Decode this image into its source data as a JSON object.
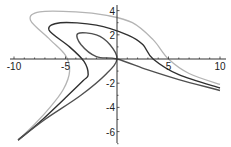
{
  "chart_data": {
    "type": "line",
    "title": "",
    "xlabel": "",
    "ylabel": "",
    "xlim": [
      -10,
      10
    ],
    "ylim": [
      -7,
      4.5
    ],
    "grid": false,
    "legend": null,
    "x_ticks": [
      "-10",
      "-5",
      "5",
      "10"
    ],
    "y_ticks": [
      "4",
      "2",
      "-2",
      "-4",
      "-6"
    ],
    "series": [
      {
        "name": "outer-curve",
        "color": "#b4b4b4",
        "points": [
          [
            -9.6,
            -6.7
          ],
          [
            -8,
            -5.4
          ],
          [
            -6.5,
            -4
          ],
          [
            -5.2,
            -2.5
          ],
          [
            -4.6,
            -1
          ],
          [
            -5,
            0.3
          ],
          [
            -6.5,
            1.6
          ],
          [
            -8.4,
            3.2
          ],
          [
            -7.5,
            3.9
          ],
          [
            -4,
            3.9
          ],
          [
            -1,
            3.6
          ],
          [
            1.5,
            3
          ],
          [
            3.5,
            1.6
          ],
          [
            5,
            0
          ],
          [
            7,
            -1.2
          ],
          [
            10,
            -2.1
          ]
        ]
      },
      {
        "name": "middle-curve",
        "color": "#303030",
        "points": [
          [
            -9.6,
            -6.7
          ],
          [
            -7.5,
            -5.2
          ],
          [
            -5,
            -3.2
          ],
          [
            -3.3,
            -1.8
          ],
          [
            -2.8,
            -1.3
          ],
          [
            -3.2,
            -0.2
          ],
          [
            -4.6,
            1
          ],
          [
            -6.6,
            2.4
          ],
          [
            -5.5,
            3
          ],
          [
            -2,
            2.8
          ],
          [
            1,
            2
          ],
          [
            2.5,
            1.2
          ],
          [
            3.5,
            0
          ],
          [
            6,
            -1.3
          ],
          [
            10,
            -2.4
          ]
        ]
      },
      {
        "name": "inner-curve",
        "color": "#505050",
        "points": [
          [
            -9.6,
            -6.7
          ],
          [
            -7,
            -5
          ],
          [
            -3.5,
            -3
          ],
          [
            -1,
            -1.2
          ],
          [
            0,
            0
          ],
          [
            -0.7,
            1.2
          ],
          [
            -2,
            2
          ],
          [
            -3.8,
            2.1
          ],
          [
            -3.5,
            1.2
          ],
          [
            -2,
            0.2
          ],
          [
            0,
            0
          ],
          [
            3,
            -0.9
          ],
          [
            6,
            -1.7
          ],
          [
            10,
            -2.6
          ]
        ]
      }
    ]
  },
  "axes": {
    "x_labels": [
      {
        "text": "-10",
        "value": -10
      },
      {
        "text": "-5",
        "value": -5
      },
      {
        "text": "5",
        "value": 5
      },
      {
        "text": "10",
        "value": 10
      }
    ],
    "y_labels": [
      {
        "text": "4",
        "value": 4
      },
      {
        "text": "2",
        "value": 2
      },
      {
        "text": "-2",
        "value": -2
      },
      {
        "text": "-4",
        "value": -4
      },
      {
        "text": "-6",
        "value": -6
      }
    ]
  }
}
